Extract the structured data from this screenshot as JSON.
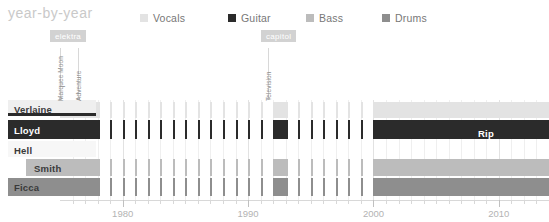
{
  "header": {
    "title": "year-by-year",
    "legend": [
      {
        "label": "Vocals",
        "color": "#e3e3e3"
      },
      {
        "label": "Guitar",
        "color": "#2b2b2b"
      },
      {
        "label": "Bass",
        "color": "#bcbcbc"
      },
      {
        "label": "Drums",
        "color": "#8e8e8e"
      }
    ]
  },
  "annotations": [
    {
      "badge": "elektra",
      "labels": [
        "Marquee Moon",
        "Adventure"
      ]
    },
    {
      "badge": "capitol",
      "labels": [
        "Television"
      ]
    }
  ],
  "inline_labels": [
    {
      "text": "Rip",
      "row": "Lloyd"
    }
  ],
  "axis": {
    "ticklabels": [
      "1980",
      "1990",
      "2000",
      "2010"
    ],
    "range": [
      1975,
      2014
    ]
  },
  "chart_data": {
    "type": "bar",
    "title": "year-by-year",
    "xlabel": "",
    "ylabel": "",
    "xlim": [
      1975,
      2014
    ],
    "grid": true,
    "legend_position": "top-right",
    "categories": [
      "Verlaine",
      "Lloyd",
      "Hell",
      "Smith",
      "Ficca"
    ],
    "series": [
      {
        "name": "Verlaine",
        "role": "Vocals",
        "color": "#e3e3e3",
        "accent": "#2b2b2b",
        "spans": [
          {
            "start": 1975,
            "end": 1978,
            "intensity": "full"
          },
          {
            "start": 1978,
            "end": 1992,
            "intensity": "sparse"
          },
          {
            "start": 1992,
            "end": 1993,
            "intensity": "full"
          },
          {
            "start": 1993,
            "end": 2000,
            "intensity": "sparse"
          },
          {
            "start": 2000,
            "end": 2014,
            "intensity": "full"
          }
        ]
      },
      {
        "name": "Lloyd",
        "role": "Guitar",
        "color": "#2b2b2b",
        "spans": [
          {
            "start": 1975,
            "end": 1978,
            "intensity": "full"
          },
          {
            "start": 1978,
            "end": 1992,
            "intensity": "sparse"
          },
          {
            "start": 1992,
            "end": 1993,
            "intensity": "full"
          },
          {
            "start": 1993,
            "end": 2000,
            "intensity": "sparse"
          },
          {
            "start": 2000,
            "end": 2007,
            "intensity": "full"
          },
          {
            "start": 2007,
            "end": 2014,
            "intensity": "full"
          }
        ]
      },
      {
        "name": "Hell",
        "role": "Bass",
        "color": "#f4f4f4",
        "spans": [
          {
            "start": 1975,
            "end": 1976,
            "intensity": "full"
          }
        ]
      },
      {
        "name": "Smith",
        "role": "Bass",
        "color": "#bcbcbc",
        "spans": [
          {
            "start": 1976,
            "end": 1978,
            "intensity": "full"
          },
          {
            "start": 1978,
            "end": 1992,
            "intensity": "sparse"
          },
          {
            "start": 1992,
            "end": 1993,
            "intensity": "full"
          },
          {
            "start": 1993,
            "end": 2000,
            "intensity": "sparse"
          },
          {
            "start": 2000,
            "end": 2014,
            "intensity": "full"
          }
        ]
      },
      {
        "name": "Ficca",
        "role": "Drums",
        "color": "#8e8e8e",
        "spans": [
          {
            "start": 1975,
            "end": 1978,
            "intensity": "full"
          },
          {
            "start": 1978,
            "end": 1992,
            "intensity": "sparse"
          },
          {
            "start": 1992,
            "end": 1993,
            "intensity": "full"
          },
          {
            "start": 1993,
            "end": 2000,
            "intensity": "sparse"
          },
          {
            "start": 2000,
            "end": 2014,
            "intensity": "full"
          }
        ]
      }
    ]
  }
}
